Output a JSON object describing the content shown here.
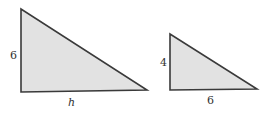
{
  "diagram": {
    "fill_color": "#e2e2e2",
    "stroke_color": "#3a3a3a",
    "triangles": [
      {
        "name": "large-triangle",
        "points": "21,9 21,92 147,90",
        "labels": {
          "height": "6",
          "base": "h"
        }
      },
      {
        "name": "small-triangle",
        "points": "170,34 170,90 257,89",
        "labels": {
          "height": "4",
          "base": "6"
        }
      }
    ]
  }
}
